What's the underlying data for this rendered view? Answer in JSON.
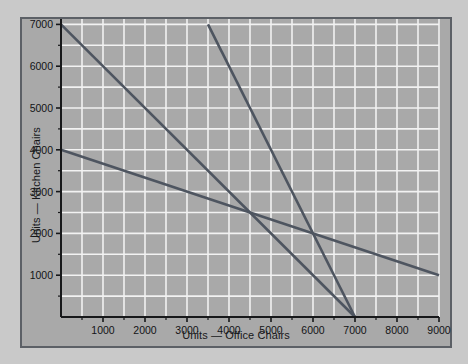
{
  "chart_data": {
    "type": "line",
    "title": "",
    "xlabel": "Units — Office Chairs",
    "ylabel": "Units — Kitchen Chairs",
    "xlim": [
      0,
      9000
    ],
    "ylim": [
      0,
      7400
    ],
    "xticks": [
      1000,
      2000,
      3000,
      4000,
      5000,
      6000,
      7000,
      8000,
      9000
    ],
    "xtick_labels": [
      "1000",
      "2000",
      "3000",
      "4000",
      "5000",
      "6000",
      "7000",
      "8000",
      "9000"
    ],
    "yticks": [
      1000,
      2000,
      3000,
      4000,
      5000,
      6000,
      7000
    ],
    "ytick_labels": [
      "1000",
      "2000",
      "3000",
      "4000",
      "5000",
      "6000",
      "7000"
    ],
    "grid": true,
    "grid_minor_step_x": 500,
    "grid_minor_step_y": 500,
    "grid_color": "#f2f2f2",
    "plot_background": "#a9a9a9",
    "line_color": "#4e5560",
    "legend": null,
    "series": [
      {
        "name": "Constraint line 1",
        "points": [
          [
            0,
            7000
          ],
          [
            7000,
            0
          ]
        ],
        "color": "#4e5560"
      },
      {
        "name": "Constraint line 2",
        "points": [
          [
            3500,
            7000
          ],
          [
            7000,
            0
          ]
        ],
        "color": "#4e5560"
      },
      {
        "name": "Constraint line 3",
        "points": [
          [
            0,
            4000
          ],
          [
            9000,
            1000
          ]
        ],
        "color": "#4e5560"
      }
    ]
  }
}
